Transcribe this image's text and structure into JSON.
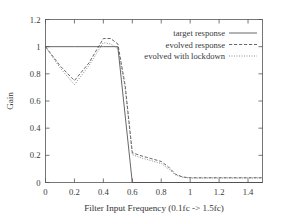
{
  "chart_data": {
    "type": "line",
    "title": "",
    "xlabel": "Filter Input Frequency (0.1fc -> 1.5fc)",
    "ylabel": "Gain",
    "xlim": [
      0,
      1.5
    ],
    "ylim": [
      0,
      1.2
    ],
    "xticks": [
      "0",
      "0.2",
      "0.4",
      "0.6",
      "0.8",
      "1",
      "1.2",
      "1.4"
    ],
    "xtick_values": [
      0,
      0.2,
      0.4,
      0.6,
      0.8,
      1.0,
      1.2,
      1.4
    ],
    "yticks": [
      "0",
      "0.2",
      "0.4",
      "0.6",
      "0.8",
      "1",
      "1.2"
    ],
    "ytick_values": [
      0,
      0.2,
      0.4,
      0.6,
      0.8,
      1.0,
      1.2
    ],
    "grid": false,
    "legend_position": "top-right",
    "series": [
      {
        "name": "target response",
        "style": "solid",
        "color": "#4c4c50",
        "x": [
          0,
          0.1,
          0.2,
          0.3,
          0.4,
          0.5,
          0.6,
          0.7,
          0.8,
          0.9,
          1.0,
          1.1,
          1.2,
          1.3,
          1.4,
          1.5
        ],
        "y": [
          1.0,
          1.0,
          1.0,
          1.0,
          1.0,
          1.0,
          0.0,
          0.0,
          0.0,
          0.0,
          0.0,
          0.0,
          0.0,
          0.0,
          0.0,
          0.0
        ]
      },
      {
        "name": "evolved response",
        "style": "dashed",
        "color": "#4c4c50",
        "x": [
          0,
          0.1,
          0.2,
          0.3,
          0.4,
          0.45,
          0.5,
          0.55,
          0.6,
          0.65,
          0.7,
          0.75,
          0.8,
          0.85,
          0.9,
          0.95,
          1.0,
          1.1,
          1.2,
          1.3,
          1.4,
          1.5
        ],
        "y": [
          1.0,
          0.86,
          0.75,
          0.88,
          1.06,
          1.06,
          1.02,
          0.72,
          0.22,
          0.2,
          0.185,
          0.17,
          0.155,
          0.115,
          0.06,
          0.04,
          0.035,
          0.035,
          0.035,
          0.035,
          0.035,
          0.035
        ]
      },
      {
        "name": "evolved with lockdown",
        "style": "dotted",
        "color": "#6d6d70",
        "x": [
          0,
          0.1,
          0.2,
          0.3,
          0.4,
          0.45,
          0.5,
          0.55,
          0.6,
          0.65,
          0.7,
          0.75,
          0.8,
          0.85,
          0.9,
          0.95,
          1.0,
          1.1,
          1.2,
          1.3,
          1.4,
          1.5
        ],
        "y": [
          1.0,
          0.845,
          0.72,
          0.86,
          1.03,
          1.02,
          0.985,
          0.7,
          0.205,
          0.185,
          0.17,
          0.155,
          0.14,
          0.1,
          0.055,
          0.038,
          0.033,
          0.033,
          0.033,
          0.033,
          0.033,
          0.033
        ]
      }
    ]
  }
}
